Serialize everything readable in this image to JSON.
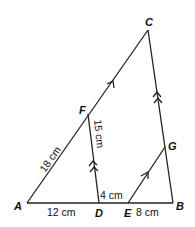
{
  "diagram": {
    "points": {
      "A": "A",
      "B": "B",
      "C": "C",
      "D": "D",
      "E": "E",
      "F": "F",
      "G": "G"
    },
    "lengths": {
      "AF": "18 cm",
      "FD": "15 cm",
      "AD": "12 cm",
      "DE": "4 cm",
      "EB": "8 cm"
    },
    "parallel_marks": {
      "single": "AC ∥ EG",
      "double": "FD ∥ CB"
    }
  }
}
